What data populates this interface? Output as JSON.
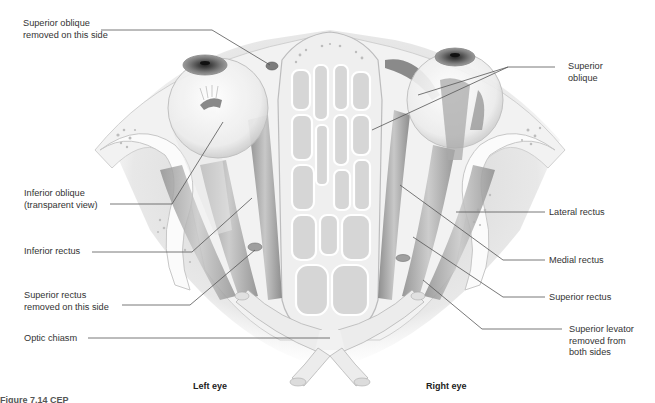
{
  "figure": {
    "colors": {
      "background": "#ffffff",
      "bone": "#f4f4f4",
      "bone_shadow": "#cfcfcf",
      "muscle": "#b9b9b9",
      "muscle_dark": "#8f8f8f",
      "leader_line": "#555555",
      "text": "#333333"
    }
  },
  "labels_left": [
    {
      "id": "superior-oblique-removed",
      "lines": [
        "Superior oblique",
        "removed on this side"
      ]
    },
    {
      "id": "inferior-oblique",
      "lines": [
        "Inferior oblique",
        "(transparent view)"
      ]
    },
    {
      "id": "inferior-rectus",
      "lines": [
        "Inferior rectus"
      ]
    },
    {
      "id": "superior-rectus-removed",
      "lines": [
        "Superior rectus",
        "removed on this side"
      ]
    },
    {
      "id": "optic-chiasm",
      "lines": [
        "Optic chiasm"
      ]
    }
  ],
  "labels_right": [
    {
      "id": "superior-oblique",
      "lines": [
        "Superior",
        "oblique"
      ]
    },
    {
      "id": "lateral-rectus",
      "lines": [
        "Lateral rectus"
      ]
    },
    {
      "id": "medial-rectus",
      "lines": [
        "Medial rectus"
      ]
    },
    {
      "id": "superior-rectus",
      "lines": [
        "Superior rectus"
      ]
    },
    {
      "id": "superior-levator",
      "lines": [
        "Superior levator",
        "removed from",
        "both sides"
      ]
    }
  ],
  "side_labels": {
    "left": "Left eye",
    "right": "Right eye"
  },
  "caption": "Figure 7.14 CEP"
}
